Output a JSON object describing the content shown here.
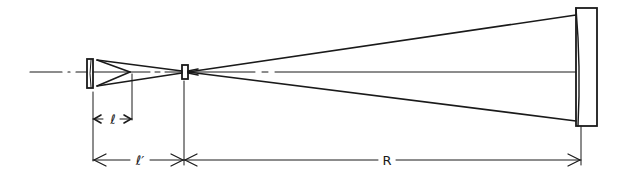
{
  "diagram": {
    "type": "optical-schematic",
    "colors": {
      "ink": "#1a1a1a",
      "background": "#ffffff"
    },
    "labels": {
      "l": "ℓ",
      "l_prime": "ℓ′",
      "R": "R"
    },
    "components": [
      {
        "id": "small-convex-mirror",
        "description": "small mirror at left"
      },
      {
        "id": "focal-point-element",
        "description": "small element at focus"
      },
      {
        "id": "large-concave-mirror",
        "description": "large mirror at right"
      }
    ],
    "dimensions": [
      {
        "id": "dim-l",
        "label_ref": "l",
        "from": "small-convex-mirror",
        "to": "beam-apex"
      },
      {
        "id": "dim-l-prime",
        "label_ref": "l_prime",
        "from": "small-convex-mirror",
        "to": "focal-point-element"
      },
      {
        "id": "dim-R",
        "label_ref": "R",
        "from": "focal-point-element",
        "to": "large-concave-mirror"
      }
    ]
  }
}
